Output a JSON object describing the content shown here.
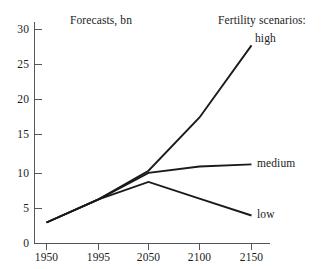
{
  "chart_data": {
    "type": "line",
    "title": "Forecasts, bn",
    "legend_title": "Fertility scenarios:",
    "legend_position": "right-inline-labels",
    "xlabel": "",
    "ylabel": "",
    "grid": false,
    "x": [
      1950,
      1995,
      2050,
      2100,
      2150
    ],
    "x_tick_labels": [
      "1950",
      "1995",
      "2050",
      "2100",
      "2150"
    ],
    "y_tick_labels": [
      "0",
      "5",
      "10",
      "15",
      "20",
      "25",
      "30"
    ],
    "y_ticks": [
      0,
      5,
      10,
      15,
      20,
      25,
      30
    ],
    "ylim": [
      0,
      31.5
    ],
    "series": [
      {
        "name": "high",
        "label": "high",
        "values": [
          3.0,
          6.3,
          10.4,
          18.0,
          28.3
        ]
      },
      {
        "name": "medium",
        "label": "medium",
        "values": [
          3.0,
          6.3,
          10.1,
          11.0,
          11.3
        ]
      },
      {
        "name": "low",
        "label": "low",
        "values": [
          3.0,
          6.3,
          8.8,
          6.4,
          4.0
        ]
      }
    ]
  },
  "annotations": {
    "chart_title": "Forecasts, bn",
    "legend_heading": "Fertility scenarios:",
    "label_high": "high",
    "label_medium": "medium",
    "label_low": "low"
  },
  "axis": {
    "y_labels": [
      "30",
      "25",
      "20",
      "15",
      "10",
      "5",
      "0"
    ],
    "x_labels": [
      "1950",
      "1995",
      "2050",
      "2100",
      "2150"
    ]
  },
  "colors": {
    "line": "#1a1a1a",
    "axis": "#55555c",
    "text": "#1c1c1c",
    "background": "#ffffff"
  }
}
